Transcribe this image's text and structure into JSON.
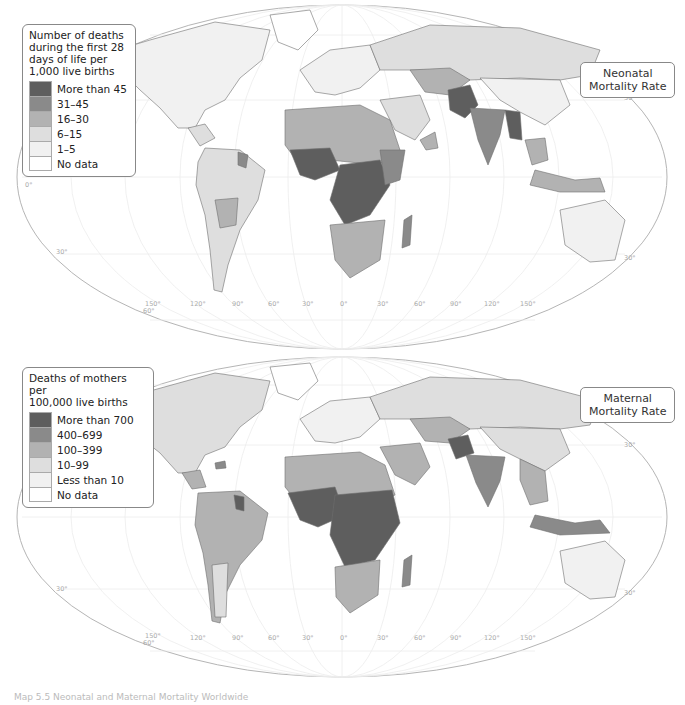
{
  "colors": {
    "c5": "#5e5e5e",
    "c4": "#8a8a8a",
    "c3": "#b2b2b2",
    "c2": "#dedede",
    "c1": "#f1f1f1",
    "c0": "#ffffff",
    "border": "#6e6e6e",
    "grid": "#e6e6e6"
  },
  "maps": [
    {
      "id": "neonatal",
      "title_line1": "Neonatal",
      "title_line2": "Mortality Rate",
      "legend": {
        "title_lines": [
          "Number of deaths",
          "during the first 28",
          "days of life per",
          "1,000 live births"
        ],
        "items": [
          {
            "label": "More than 45",
            "color": "#5e5e5e"
          },
          {
            "label": "31–45",
            "color": "#8a8a8a"
          },
          {
            "label": "16–30",
            "color": "#b2b2b2"
          },
          {
            "label": "6–15",
            "color": "#dedede"
          },
          {
            "label": "1–5",
            "color": "#f1f1f1"
          },
          {
            "label": "No data",
            "color": "#ffffff"
          }
        ]
      },
      "lat_labels": [
        "30°",
        "0°",
        "30°",
        "30°",
        "60°"
      ],
      "lon_labels": [
        "150°",
        "120°",
        "90°",
        "60°",
        "30°",
        "0°",
        "30°",
        "60°",
        "90°",
        "120°",
        "150°"
      ]
    },
    {
      "id": "maternal",
      "title_line1": "Maternal",
      "title_line2": "Mortality Rate",
      "legend": {
        "title_lines": [
          "Deaths of mothers per",
          "100,000 live births"
        ],
        "items": [
          {
            "label": "More than 700",
            "color": "#5e5e5e"
          },
          {
            "label": "400–699",
            "color": "#8a8a8a"
          },
          {
            "label": "100–399",
            "color": "#b2b2b2"
          },
          {
            "label": "10–99",
            "color": "#dedede"
          },
          {
            "label": "Less than 10",
            "color": "#f1f1f1"
          },
          {
            "label": "No data",
            "color": "#ffffff"
          }
        ]
      },
      "lat_labels": [
        "30°",
        "30°",
        "30°",
        "60°"
      ],
      "lon_labels": [
        "150°",
        "120°",
        "90°",
        "60°",
        "30°",
        "0°",
        "30°",
        "60°",
        "90°",
        "120°",
        "150°"
      ]
    }
  ],
  "caption": "Map 5.5  Neonatal and Maternal Mortality Worldwide"
}
